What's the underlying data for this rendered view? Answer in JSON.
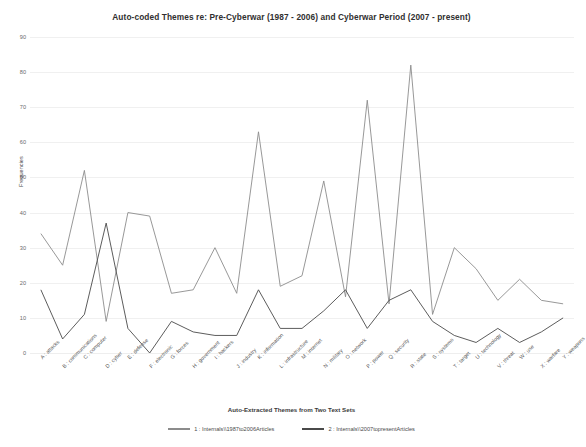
{
  "chart_data": {
    "type": "line",
    "title": "Auto-coded Themes re: Pre-Cyberwar (1987 - 2006) and Cyberwar Period (2007 - present)",
    "xlabel": "Auto-Extracted Themes from Two Text Sets",
    "ylabel": "Frequencies",
    "ylim": [
      0,
      90
    ],
    "yticks": [
      0,
      10,
      20,
      30,
      40,
      50,
      60,
      70,
      80,
      90
    ],
    "grid": true,
    "legend_position": "bottom",
    "categories": [
      "A : attacks",
      "B : communications",
      "C : computer",
      "D : cyber",
      "E : defense",
      "F : electronic",
      "G : forces",
      "H : government",
      "I : hackers",
      "J : industry",
      "K : information",
      "L : infrastructure",
      "M : internet",
      "N : military",
      "O : network",
      "P : power",
      "Q : security",
      "R : state",
      "S : systems",
      "T : target",
      "U : technology",
      "V : threat",
      "W : use",
      "X : warfare",
      "Y : weapons"
    ],
    "series": [
      {
        "name": "1 : Internals\\\\1987to2006Articles",
        "color": "#8c8c8c",
        "values": [
          34,
          25,
          52,
          9,
          40,
          39,
          17,
          18,
          30,
          17,
          63,
          19,
          22,
          49,
          16,
          72,
          14,
          82,
          11,
          30,
          24,
          15,
          21,
          15,
          14
        ]
      },
      {
        "name": "2 : Internals\\\\2007topresentArticles",
        "color": "#4a4a4a",
        "values": [
          18,
          4,
          11,
          37,
          7,
          0,
          9,
          6,
          5,
          5,
          18,
          7,
          7,
          12,
          18,
          7,
          15,
          18,
          9,
          5,
          3,
          7,
          3,
          6,
          10
        ]
      }
    ]
  },
  "legend": {
    "items": [
      {
        "label": "1 : Internals\\\\1987to2006Articles",
        "color": "#8c8c8c"
      },
      {
        "label": "2 : Internals\\\\2007topresentArticles",
        "color": "#4a4a4a"
      }
    ]
  }
}
